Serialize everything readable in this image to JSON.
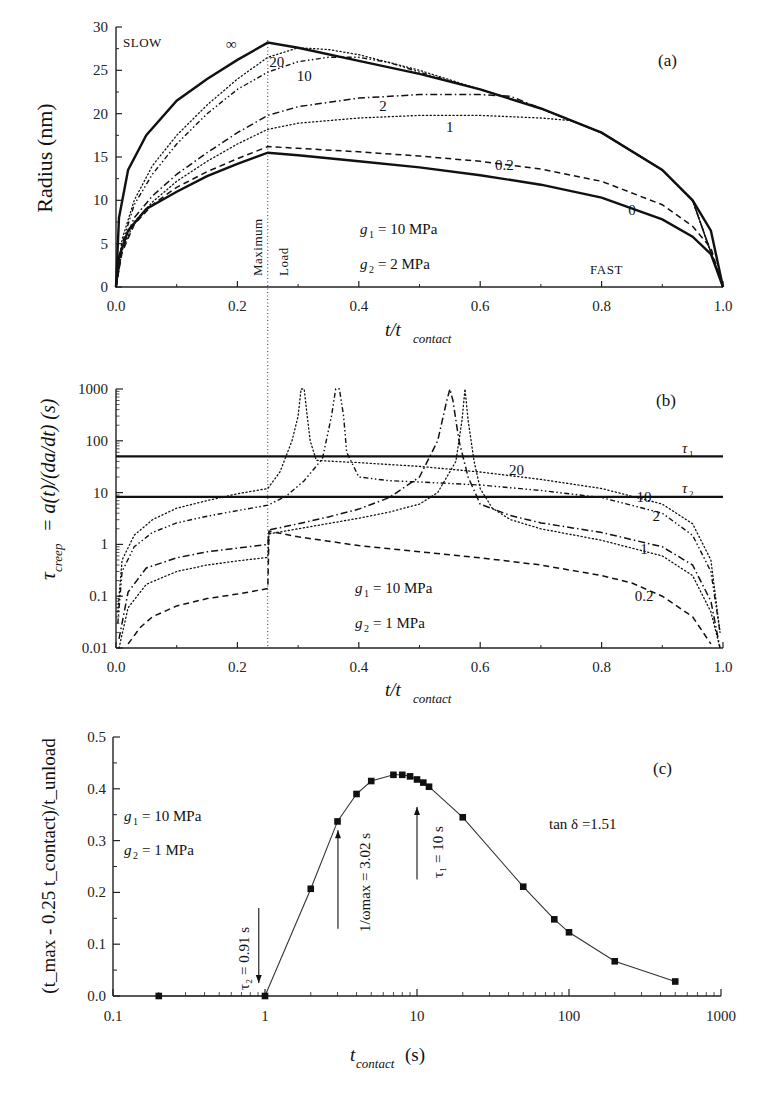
{
  "figure": {
    "panels": [
      "(a)",
      "(b)",
      "(c)"
    ]
  },
  "chart_data": [
    {
      "panel": "(a)",
      "type": "line",
      "title": "",
      "xlabel": "t/t_contact",
      "xlabel_main": "t/t",
      "xlabel_sub": "contact",
      "ylabel": "Radius (nm)",
      "xlim": [
        0.0,
        1.0
      ],
      "ylim": [
        0,
        30
      ],
      "x_ticks": [
        "0.0",
        "0.2",
        "0.4",
        "0.6",
        "0.8",
        "1.0"
      ],
      "y_ticks": [
        "0",
        "5",
        "10",
        "15",
        "20",
        "25",
        "30"
      ],
      "annotations": {
        "slow": "SLOW",
        "fast": "FAST",
        "max_load_1": "Maximum",
        "max_load_2": "Load",
        "g1": "= 10 MPa",
        "g2": "= 2 MPa",
        "g1_sym": "g",
        "g2_sym": "g",
        "g1_sub": "1",
        "g2_sub": "2",
        "panel_letter": "(a)"
      },
      "vertical_marker_x": 0.25,
      "series": [
        {
          "name": "∞",
          "style": "solid-thick",
          "x": [
            0,
            0.005,
            0.02,
            0.05,
            0.1,
            0.15,
            0.2,
            0.25,
            0.3,
            0.4,
            0.5,
            0.6,
            0.7,
            0.8,
            0.9,
            0.95,
            0.98,
            1.0
          ],
          "y": [
            0,
            8,
            13.5,
            17.5,
            21.5,
            24,
            26.2,
            28.2,
            27.6,
            26.1,
            24.6,
            22.8,
            20.6,
            17.8,
            13.5,
            10,
            6.5,
            0
          ]
        },
        {
          "name": "20",
          "style": "dotted",
          "x": [
            0,
            0.01,
            0.03,
            0.06,
            0.1,
            0.15,
            0.2,
            0.25,
            0.3,
            0.35,
            0.4,
            0.5,
            0.6,
            0.7,
            0.8,
            0.9,
            0.95,
            1.0
          ],
          "y": [
            0,
            5.5,
            10,
            14,
            17.5,
            21,
            24,
            26.5,
            27.6,
            27.4,
            26.8,
            25,
            22.8,
            20.6,
            17.8,
            13.5,
            10,
            0
          ]
        },
        {
          "name": "10",
          "style": "dash-dot-dot",
          "x": [
            0,
            0.01,
            0.03,
            0.06,
            0.1,
            0.15,
            0.2,
            0.25,
            0.3,
            0.35,
            0.4,
            0.45,
            0.5,
            0.6,
            0.7,
            0.8,
            0.9,
            0.95,
            1.0
          ],
          "y": [
            0,
            5,
            9.5,
            13,
            16.5,
            20,
            22.8,
            24.8,
            26,
            26.5,
            26.5,
            25.9,
            24.8,
            22.8,
            20.6,
            17.8,
            13.5,
            10,
            0
          ]
        },
        {
          "name": "2",
          "style": "dash-dot",
          "x": [
            0,
            0.01,
            0.03,
            0.06,
            0.1,
            0.15,
            0.2,
            0.25,
            0.3,
            0.4,
            0.5,
            0.6,
            0.65,
            0.7,
            0.8,
            0.9,
            0.95,
            1.0
          ],
          "y": [
            0,
            4.5,
            8,
            10.5,
            13,
            15.5,
            17.8,
            19.8,
            20.8,
            21.8,
            22.2,
            22.2,
            22.0,
            20.6,
            17.8,
            13.5,
            10,
            0
          ]
        },
        {
          "name": "1",
          "style": "dotted",
          "x": [
            0,
            0.01,
            0.03,
            0.06,
            0.1,
            0.15,
            0.2,
            0.25,
            0.3,
            0.4,
            0.5,
            0.6,
            0.7,
            0.75,
            0.8,
            0.9,
            0.95,
            1.0
          ],
          "y": [
            0,
            4.2,
            7.5,
            9.8,
            12.2,
            14.5,
            16.5,
            18.2,
            18.9,
            19.5,
            19.8,
            19.8,
            19.5,
            19.2,
            17.8,
            13.5,
            10,
            0
          ]
        },
        {
          "name": "0.2",
          "style": "dashed",
          "x": [
            0,
            0.01,
            0.03,
            0.06,
            0.1,
            0.15,
            0.2,
            0.25,
            0.3,
            0.4,
            0.5,
            0.6,
            0.7,
            0.8,
            0.9,
            0.95,
            0.98,
            1.0
          ],
          "y": [
            0,
            4,
            7.2,
            9.5,
            11.5,
            13.3,
            14.8,
            16.2,
            16.0,
            15.6,
            15.1,
            14.5,
            13.6,
            12.2,
            9.5,
            7,
            4.5,
            0
          ]
        },
        {
          "name": "0",
          "style": "solid-thick",
          "x": [
            0,
            0.005,
            0.02,
            0.05,
            0.1,
            0.15,
            0.2,
            0.25,
            0.3,
            0.4,
            0.5,
            0.6,
            0.7,
            0.8,
            0.9,
            0.95,
            0.98,
            1.0
          ],
          "y": [
            0,
            3.5,
            6.5,
            9,
            11,
            12.8,
            14.2,
            15.5,
            15.2,
            14.5,
            13.8,
            12.9,
            11.8,
            10.3,
            7.8,
            5.8,
            3.8,
            0
          ]
        }
      ],
      "curve_labels": [
        {
          "text": "∞",
          "x": 0.19,
          "y": 27.5
        },
        {
          "text": "20",
          "x": 0.265,
          "y": 25.4
        },
        {
          "text": "10",
          "x": 0.31,
          "y": 23.8
        },
        {
          "text": "2",
          "x": 0.44,
          "y": 20.3
        },
        {
          "text": "1",
          "x": 0.55,
          "y": 17.9
        },
        {
          "text": "0.2",
          "x": 0.64,
          "y": 13.5
        },
        {
          "text": "0",
          "x": 0.85,
          "y": 8.3
        }
      ]
    },
    {
      "panel": "(b)",
      "type": "line",
      "title": "",
      "xlabel": "t/t_contact",
      "xlabel_main": "t/t",
      "xlabel_sub": "contact",
      "ylabel": "τ_creep = a(t)/(da/dt) (s)",
      "ylabel_sym": "τ",
      "ylabel_sub": "creep",
      "ylabel_rest": " = a(t)/(da/dt)  (s)",
      "xlim": [
        0.0,
        1.0
      ],
      "ylim": [
        0.01,
        1000
      ],
      "yscale": "log",
      "x_ticks": [
        "0.0",
        "0.2",
        "0.4",
        "0.6",
        "0.8",
        "1.0"
      ],
      "y_ticks": [
        "0.01",
        "0.1",
        "1",
        "10",
        "100",
        "1000"
      ],
      "annotations": {
        "g1": "= 10 MPa",
        "g2": "= 1 MPa",
        "g1_sym": "g",
        "g2_sym": "g",
        "g1_sub": "1",
        "g2_sub": "2",
        "tau1": "τ",
        "tau1_sub": "1",
        "tau2": "τ",
        "tau2_sub": "2",
        "panel_letter": "(b)"
      },
      "horizontal_lines": [
        {
          "name": "τ1",
          "y": 50
        },
        {
          "name": "τ2",
          "y": 8.3
        }
      ],
      "vertical_marker_x": 0.25,
      "series": [
        {
          "name": "20",
          "style": "dotted",
          "x": [
            0.003,
            0.01,
            0.03,
            0.06,
            0.1,
            0.15,
            0.2,
            0.25,
            0.27,
            0.29,
            0.3,
            0.305,
            0.31,
            0.315,
            0.32,
            0.33,
            0.36,
            0.4,
            0.5,
            0.6,
            0.7,
            0.8,
            0.9,
            0.95,
            0.98,
            0.995
          ],
          "y": [
            0.05,
            0.5,
            1.5,
            3,
            5,
            7,
            9.5,
            12,
            25,
            100,
            300,
            1000,
            1000,
            300,
            100,
            42,
            40,
            38,
            32,
            25,
            18,
            12,
            6,
            2.5,
            0.5,
            0.02
          ]
        },
        {
          "name": "10",
          "style": "dash-dot-dot",
          "x": [
            0.003,
            0.01,
            0.03,
            0.06,
            0.1,
            0.15,
            0.2,
            0.25,
            0.28,
            0.31,
            0.34,
            0.355,
            0.362,
            0.368,
            0.375,
            0.38,
            0.4,
            0.45,
            0.5,
            0.6,
            0.7,
            0.8,
            0.9,
            0.95,
            0.98,
            0.995
          ],
          "y": [
            0.03,
            0.3,
            0.9,
            1.7,
            2.6,
            3.5,
            4.5,
            5.7,
            8.5,
            17,
            45,
            300,
            1000,
            1000,
            300,
            60,
            20,
            17,
            16,
            14,
            11,
            8,
            4,
            1.5,
            0.3,
            0.02
          ]
        },
        {
          "name": "2",
          "style": "dash-dot",
          "x": [
            0.005,
            0.02,
            0.05,
            0.1,
            0.15,
            0.2,
            0.25,
            0.252,
            0.3,
            0.35,
            0.4,
            0.45,
            0.5,
            0.53,
            0.545,
            0.55,
            0.555,
            0.565,
            0.58,
            0.6,
            0.65,
            0.7,
            0.8,
            0.9,
            0.95,
            0.98,
            0.995
          ],
          "y": [
            0.015,
            0.12,
            0.35,
            0.55,
            0.72,
            0.85,
            1.0,
            1.9,
            2.5,
            3.4,
            4.8,
            8,
            20,
            100,
            600,
            1000,
            600,
            100,
            20,
            6,
            3.6,
            2.6,
            1.7,
            0.9,
            0.4,
            0.08,
            0.01
          ]
        },
        {
          "name": "1",
          "style": "dotted",
          "x": [
            0.005,
            0.02,
            0.05,
            0.1,
            0.15,
            0.2,
            0.25,
            0.252,
            0.3,
            0.4,
            0.45,
            0.5,
            0.53,
            0.56,
            0.57,
            0.575,
            0.58,
            0.59,
            0.6,
            0.62,
            0.65,
            0.7,
            0.8,
            0.9,
            0.95,
            0.98,
            0.995
          ],
          "y": [
            0.01,
            0.06,
            0.17,
            0.3,
            0.4,
            0.48,
            0.56,
            1.6,
            2,
            3.2,
            4.2,
            6,
            10,
            40,
            250,
            1000,
            250,
            40,
            12,
            5,
            3,
            2,
            1.2,
            0.6,
            0.25,
            0.05,
            0.01
          ]
        },
        {
          "name": "0.2",
          "style": "dashed",
          "x": [
            0.02,
            0.04,
            0.06,
            0.1,
            0.15,
            0.2,
            0.25,
            0.252,
            0.3,
            0.4,
            0.5,
            0.6,
            0.7,
            0.8,
            0.85,
            0.9,
            0.95,
            0.98
          ],
          "y": [
            0.012,
            0.025,
            0.04,
            0.065,
            0.09,
            0.11,
            0.14,
            1.8,
            1.4,
            0.95,
            0.72,
            0.55,
            0.4,
            0.25,
            0.18,
            0.1,
            0.04,
            0.012
          ]
        }
      ],
      "curve_labels": [
        {
          "text": "20",
          "x": 0.66,
          "y": 22
        },
        {
          "text": "10",
          "x": 0.87,
          "y": 6.5
        },
        {
          "text": "2",
          "x": 0.89,
          "y": 2.8
        },
        {
          "text": "1",
          "x": 0.87,
          "y": 0.65
        },
        {
          "text": "0.2",
          "x": 0.87,
          "y": 0.08
        }
      ]
    },
    {
      "panel": "(c)",
      "type": "scatter",
      "title": "",
      "xlabel": "t_contact (s)",
      "xlabel_main": "t",
      "xlabel_sub": "contact",
      "xlabel_unit": "(s)",
      "ylabel": "(t_max - 0.25 t_contact)/t_unload",
      "xlim": [
        0.1,
        1000
      ],
      "xscale": "log",
      "ylim": [
        0.0,
        0.5
      ],
      "x_ticks": [
        "0.1",
        "1",
        "10",
        "100",
        "1000"
      ],
      "y_ticks": [
        "0.0",
        "0.1",
        "0.2",
        "0.3",
        "0.4",
        "0.5"
      ],
      "annotations": {
        "g1": "= 10 MPa",
        "g2": "= 1 MPa",
        "g1_sym": "g",
        "g2_sym": "g",
        "g1_sub": "1",
        "g2_sub": "2",
        "tan_delta": "tan δ =1.51",
        "tau2_arrow": "τ₂ = 0.91 s",
        "omega_arrow": "1/ωmax = 3.02 s",
        "tau1_arrow": "τ₁ = 10 s",
        "panel_letter": "(c)"
      },
      "arrows": [
        {
          "label": "τ2 = 0.91 s",
          "x": 0.91,
          "direction": "down",
          "y_from": 0.17,
          "y_to": 0.025
        },
        {
          "label": "1/ωmax = 3.02 s",
          "x": 3.02,
          "direction": "up",
          "y_from": 0.13,
          "y_to": 0.32
        },
        {
          "label": "τ1 = 10 s",
          "x": 10,
          "direction": "up",
          "y_from": 0.225,
          "y_to": 0.365
        }
      ],
      "x": [
        0.2,
        1,
        2,
        3,
        4,
        5,
        7,
        8,
        9,
        10,
        11,
        12,
        20,
        50,
        80,
        100,
        200,
        500
      ],
      "y": [
        0.0,
        0.0,
        0.207,
        0.337,
        0.39,
        0.415,
        0.427,
        0.427,
        0.424,
        0.418,
        0.412,
        0.404,
        0.345,
        0.211,
        0.148,
        0.123,
        0.067,
        0.028
      ]
    }
  ]
}
